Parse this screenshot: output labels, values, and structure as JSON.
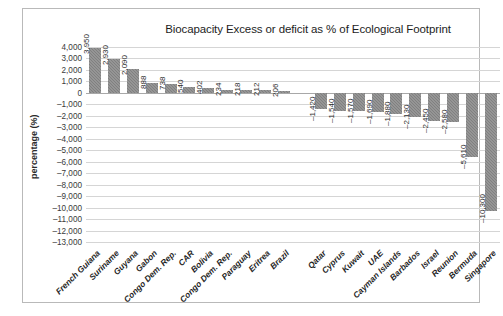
{
  "chart_data": {
    "type": "bar",
    "title": "Biocapacity Excess or deficit as % of Ecological Footprint",
    "xlabel": "",
    "ylabel": "percentage (%)",
    "ylim": [
      -13000,
      4000
    ],
    "ytick_step": 1000,
    "grid": true,
    "legend": "none",
    "bar_color": "#808080",
    "gridline_color": "#d5d5d5",
    "categories": [
      "French Guiana",
      "Suriname",
      "Guyana",
      "Gabon",
      "Congo Dem. Rep.",
      "CAR",
      "Bolivia",
      "Congo Dem. Rep.",
      "Paraguay",
      "Eritrea",
      "Brazil",
      "",
      "Qatar",
      "Cyprus",
      "Kuwait",
      "UAE",
      "Cayman Islands",
      "Barbados",
      "Israel",
      "Reunion",
      "Bermuda",
      "Singapore"
    ],
    "values": [
      3950,
      2930,
      2090,
      888,
      738,
      540,
      402,
      234,
      218,
      212,
      206,
      null,
      -1420,
      -1540,
      -1570,
      -1690,
      -1880,
      -2130,
      -2450,
      -2580,
      -5610,
      -10300
    ],
    "value_labels": [
      "3,950",
      "2,930",
      "2,090",
      "888",
      "738",
      "540",
      "402",
      "234",
      "218",
      "212",
      "206",
      "",
      "–1,420",
      "–1,540",
      "–1,570",
      "–1,690",
      "–1,880",
      "–2,130",
      "–2,450",
      "–2,580",
      "–5,610",
      "–10,300"
    ],
    "ytick_labels": [
      "4,000",
      "3,000",
      "2,000",
      "1,000",
      "0",
      "–1,000",
      "–2,000",
      "–3,000",
      "–4,000",
      "–5,000",
      "–6,000",
      "–7,000",
      "–8,000",
      "–9,000",
      "–10,000",
      "–11,000",
      "–12,000",
      "–13,000"
    ],
    "ytick_values": [
      4000,
      3000,
      2000,
      1000,
      0,
      -1000,
      -2000,
      -3000,
      -4000,
      -5000,
      -6000,
      -7000,
      -8000,
      -9000,
      -10000,
      -11000,
      -12000,
      -13000
    ]
  }
}
